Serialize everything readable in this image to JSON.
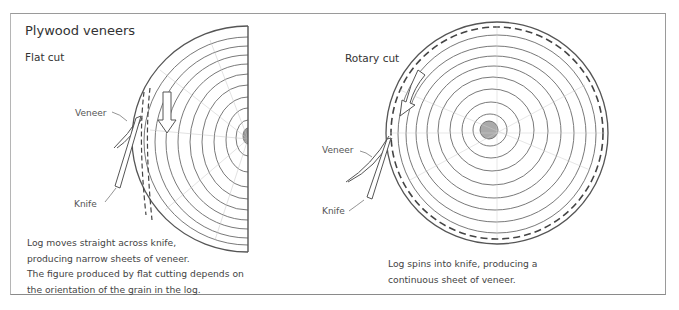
{
  "figure": {
    "title": "Plywood veneers",
    "panels": [
      {
        "heading": "Flat cut",
        "labels": {
          "veneer": "Veneer",
          "knife": "Knife"
        },
        "caption_lines": [
          "Log moves straight across knife,",
          "producing narrow sheets of veneer.",
          "The figure produced by flat cutting depends on",
          "the orientation of the grain in the log."
        ]
      },
      {
        "heading": "Rotary cut",
        "labels": {
          "veneer": "Veneer",
          "knife": "Knife"
        },
        "caption_lines": [
          "Log spins into knife, producing a",
          "continuous sheet of veneer."
        ]
      }
    ],
    "icons": {
      "flat_arrow": "arrow-down-icon",
      "rotary_arrow": "arrow-curved-counterclockwise-icon"
    },
    "colors": {
      "line": "#555555",
      "rings": "#6a6a6a",
      "frame": "#9a9a9a",
      "text": "#3a3a3a"
    }
  }
}
